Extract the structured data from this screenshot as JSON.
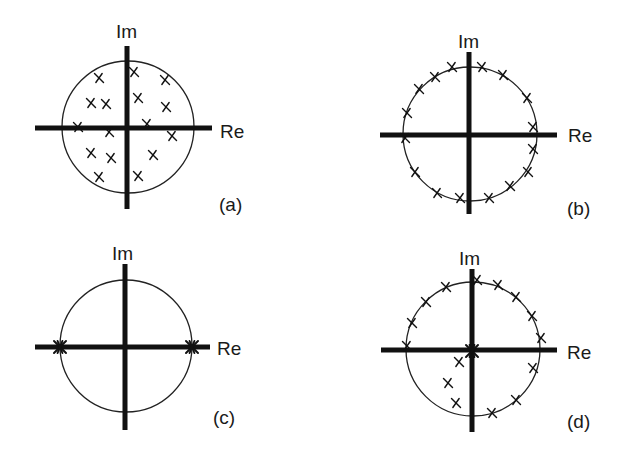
{
  "figure": {
    "colors": {
      "background": "#ffffff",
      "ink": "#111111",
      "circle": "#222222"
    },
    "axis_labels": {
      "imag": "Im",
      "real": "Re"
    },
    "panels": [
      {
        "id": "a",
        "caption": "(a)",
        "center": [
          128,
          127
        ],
        "radius": 66,
        "h_axis": [
          35,
          212
        ],
        "v_axis": [
          46,
          209
        ],
        "im_label_pos": [
          116,
          22
        ],
        "re_label_pos": [
          220,
          122
        ],
        "caption_pos": [
          219,
          195
        ],
        "markers": [
          [
            99,
            78
          ],
          [
            134,
            72
          ],
          [
            165,
            80
          ],
          [
            91,
            103
          ],
          [
            106,
            104
          ],
          [
            138,
            98
          ],
          [
            166,
            107
          ],
          [
            78,
            127
          ],
          [
            147,
            124
          ],
          [
            109,
            132
          ],
          [
            172,
            136
          ],
          [
            91,
            153
          ],
          [
            111,
            158
          ],
          [
            153,
            155
          ],
          [
            99,
            177
          ],
          [
            138,
            176
          ]
        ],
        "description": "Roots scattered inside the unit circle"
      },
      {
        "id": "b",
        "caption": "(b)",
        "center": [
          470,
          134
        ],
        "radius": 67,
        "h_axis": [
          380,
          557
        ],
        "v_axis": [
          52,
          214
        ],
        "im_label_pos": [
          458,
          32
        ],
        "re_label_pos": [
          568,
          126
        ],
        "caption_pos": [
          567,
          199
        ],
        "markers": [
          [
            452,
            67
          ],
          [
            482,
            67
          ],
          [
            503,
            75
          ],
          [
            435,
            77
          ],
          [
            419,
            89
          ],
          [
            527,
            98
          ],
          [
            407,
            113
          ],
          [
            533,
            127
          ],
          [
            405,
            138
          ],
          [
            533,
            149
          ],
          [
            415,
            172
          ],
          [
            528,
            172
          ],
          [
            510,
            186
          ],
          [
            437,
            193
          ],
          [
            460,
            198
          ],
          [
            489,
            198
          ]
        ],
        "description": "Roots distributed evenly on the unit circle"
      },
      {
        "id": "c",
        "caption": "(c)",
        "center": [
          126,
          346
        ],
        "radius": 66,
        "h_axis": [
          35,
          210
        ],
        "v_axis": [
          264,
          430
        ],
        "im_label_pos": [
          112,
          244
        ],
        "re_label_pos": [
          217,
          339
        ],
        "caption_pos": [
          213,
          408
        ],
        "markers": [],
        "stars": [
          [
            60,
            347
          ],
          [
            192,
            347
          ]
        ],
        "description": "Roots clustered at +1 and -1 on the real axis"
      },
      {
        "id": "d",
        "caption": "(d)",
        "center": [
          473,
          349
        ],
        "radius": 67,
        "h_axis": [
          381,
          557
        ],
        "v_axis": [
          269,
          432
        ],
        "im_label_pos": [
          459,
          249
        ],
        "re_label_pos": [
          567,
          343
        ],
        "caption_pos": [
          567,
          412
        ],
        "markers": [
          [
            477,
            280
          ],
          [
            498,
            285
          ],
          [
            446,
            287
          ],
          [
            426,
            302
          ],
          [
            516,
            297
          ],
          [
            412,
            323
          ],
          [
            532,
            316
          ],
          [
            407,
            346
          ],
          [
            541,
            338
          ],
          [
            533,
            368
          ],
          [
            516,
            400
          ],
          [
            492,
            413
          ],
          [
            459,
            362
          ],
          [
            448,
            383
          ],
          [
            456,
            403
          ]
        ],
        "stars": [
          [
            472,
            351
          ]
        ],
        "description": "Most roots on the unit circle, some inside, cluster at origin"
      }
    ]
  }
}
